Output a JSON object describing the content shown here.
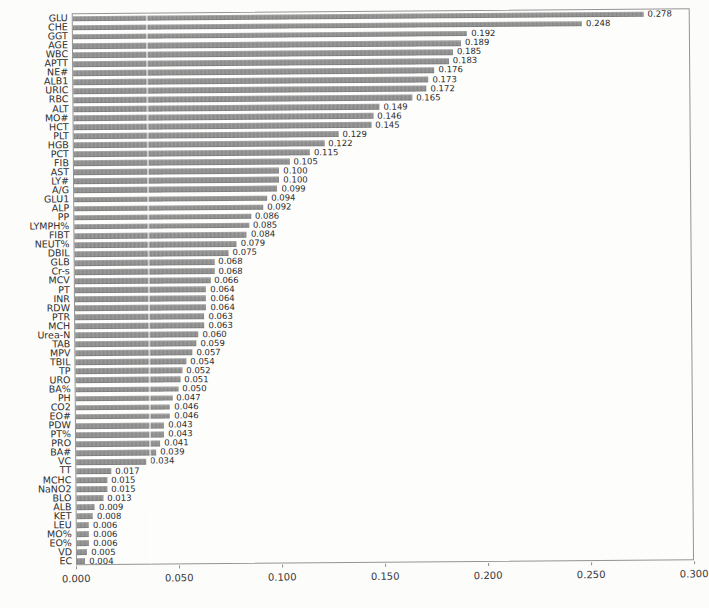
{
  "chart_data": {
    "type": "bar",
    "orientation": "horizontal",
    "title": "",
    "xlabel": "",
    "ylabel": "",
    "xlim": [
      0.0,
      0.3
    ],
    "xticks": [
      "0.000",
      "0.050",
      "0.100",
      "0.150",
      "0.200",
      "0.250",
      "0.300"
    ],
    "grid": false,
    "legend_position": "none",
    "bar_color": "#8f8f8f",
    "value_label_decimals": 3,
    "categories": [
      "GLU",
      "CHE",
      "GGT",
      "AGE",
      "WBC",
      "APTT",
      "NE#",
      "ALB1",
      "URIC",
      "RBC",
      "ALT",
      "MO#",
      "HCT",
      "PLT",
      "HGB",
      "PCT",
      "FIB",
      "AST",
      "LY#",
      "A/G",
      "GLU1",
      "ALP",
      "PP",
      "LYMPH%",
      "FIBT",
      "NEUT%",
      "DBIL",
      "GLB",
      "Cr-s",
      "MCV",
      "PT",
      "INR",
      "RDW",
      "PTR",
      "MCH",
      "Urea-N",
      "TAB",
      "MPV",
      "TBIL",
      "TP",
      "URO",
      "BA%",
      "PH",
      "CO2",
      "EO#",
      "PDW",
      "PT%",
      "PRO",
      "BA#",
      "VC",
      "TT",
      "MCHC",
      "NaNO2",
      "BLO",
      "ALB",
      "KET",
      "LEU",
      "MO%",
      "EO%",
      "VD",
      "EC"
    ],
    "values": [
      0.278,
      0.248,
      0.192,
      0.189,
      0.185,
      0.183,
      0.176,
      0.173,
      0.172,
      0.165,
      0.149,
      0.146,
      0.145,
      0.129,
      0.122,
      0.115,
      0.105,
      0.1,
      0.1,
      0.099,
      0.094,
      0.092,
      0.086,
      0.085,
      0.084,
      0.079,
      0.075,
      0.068,
      0.068,
      0.066,
      0.064,
      0.064,
      0.064,
      0.063,
      0.063,
      0.06,
      0.059,
      0.057,
      0.054,
      0.052,
      0.051,
      0.05,
      0.047,
      0.046,
      0.046,
      0.043,
      0.043,
      0.041,
      0.039,
      0.034,
      0.017,
      0.015,
      0.015,
      0.013,
      0.009,
      0.008,
      0.006,
      0.006,
      0.006,
      0.005,
      0.004
    ]
  },
  "style": {
    "paper_color": "#fcfcfb",
    "bar_color": "#8f8f8f",
    "frame_color": "#949494",
    "text_color": "#2e2e2e"
  }
}
